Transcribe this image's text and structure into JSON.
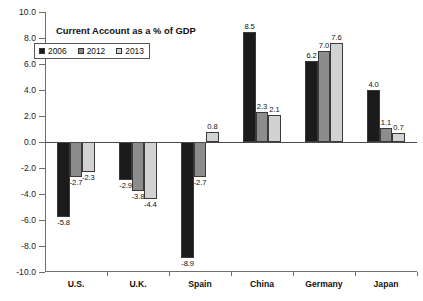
{
  "chart_data": {
    "type": "bar",
    "title": "Current Account as a % of GDP",
    "xlabel": "",
    "ylabel": "",
    "ylim": [
      -10.0,
      10.0
    ],
    "ytick_labels": [
      "10.0",
      "8.0",
      "6.0",
      "4.0",
      "2.0",
      "0.0",
      "-2.0",
      "-4.0",
      "-6.0",
      "-8.0",
      "-10.0"
    ],
    "ytick_values": [
      10,
      8,
      6,
      4,
      2,
      0,
      -2,
      -4,
      -6,
      -8,
      -10
    ],
    "grid": false,
    "legend_position": "top-left",
    "categories": [
      "U.S.",
      "U.K.",
      "Spain",
      "China",
      "Germany",
      "Japan"
    ],
    "series": [
      {
        "name": "2006",
        "color": "#1b1b1b",
        "values": [
          -5.8,
          -2.9,
          -8.9,
          8.5,
          6.2,
          4.0
        ],
        "labels": [
          "-5.8",
          "-2.9",
          "-8.9",
          "8.5",
          "6.2",
          "4.0"
        ]
      },
      {
        "name": "2012",
        "color": "#8c8c8c",
        "values": [
          -2.7,
          -3.8,
          -2.7,
          2.3,
          7.0,
          1.1
        ],
        "labels": [
          "-2.7",
          "-3.8",
          "-2.7",
          "2.3",
          "7.0",
          "1.1"
        ]
      },
      {
        "name": "2013",
        "color": "#d2d2d2",
        "values": [
          -2.3,
          -4.4,
          0.8,
          2.1,
          7.6,
          0.7
        ],
        "labels": [
          "-2.3",
          "-4.4",
          "0.8",
          "2.1",
          "7.6",
          "0.7"
        ]
      }
    ]
  }
}
